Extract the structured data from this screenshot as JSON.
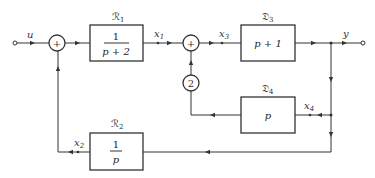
{
  "diagram": {
    "type": "block-diagram",
    "input": {
      "label": "u"
    },
    "output": {
      "label": "y"
    },
    "blocks": [
      {
        "id": "R1",
        "name": "ℛ",
        "sub": "1",
        "tf_num": "1",
        "tf_den": "p + 2"
      },
      {
        "id": "D3",
        "name": "𝔇",
        "sub": "3",
        "tf": "p + 1"
      },
      {
        "id": "D4",
        "name": "𝔇",
        "sub": "4",
        "tf": "p"
      },
      {
        "id": "R2",
        "name": "ℛ",
        "sub": "2",
        "tf_num": "1",
        "tf_den": "p"
      }
    ],
    "summers": [
      {
        "id": "sum1",
        "symbol": "+"
      },
      {
        "id": "sum2",
        "symbol": "+"
      }
    ],
    "gain": {
      "value": "2"
    },
    "signals": [
      {
        "name": "x",
        "sub": "1"
      },
      {
        "name": "x",
        "sub": "2"
      },
      {
        "name": "x",
        "sub": "3"
      },
      {
        "name": "x",
        "sub": "4"
      }
    ]
  }
}
